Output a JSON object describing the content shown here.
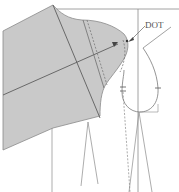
{
  "diagram": {
    "type": "sleeve-drafting-pattern",
    "labels": {
      "dot": "DOT"
    },
    "colors": {
      "fill": "#c9c9c9",
      "line": "#6e6e6e",
      "background": "#ffffff"
    }
  }
}
